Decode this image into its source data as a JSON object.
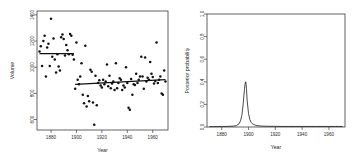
{
  "figure": {
    "title": "",
    "background": "#ffffff",
    "point_color": "#111111",
    "line_color": "#101010",
    "axis_color": "#3d3d3d"
  },
  "chart_data": [
    {
      "type": "scatter",
      "panel": "left",
      "title": "",
      "xlabel": "Year",
      "ylabel": "Volume",
      "xlim": [
        1869,
        1972
      ],
      "ylim": [
        520,
        1430
      ],
      "grid": false,
      "legend": null,
      "xticks": [
        1880,
        1900,
        1920,
        1940,
        1960
      ],
      "xticklabels": [
        "1880",
        "1900",
        "1920",
        "1940",
        "1960"
      ],
      "yticks": [
        600,
        800,
        1000,
        1200,
        1400
      ],
      "yticklabels": [
        "600",
        "800",
        "1000",
        "1200",
        "1400"
      ],
      "x": [
        1871,
        1872,
        1873,
        1874,
        1875,
        1876,
        1877,
        1878,
        1879,
        1880,
        1881,
        1882,
        1883,
        1884,
        1885,
        1886,
        1887,
        1888,
        1889,
        1890,
        1891,
        1892,
        1893,
        1894,
        1895,
        1896,
        1897,
        1898,
        1899,
        1900,
        1901,
        1902,
        1903,
        1904,
        1905,
        1906,
        1907,
        1908,
        1909,
        1910,
        1911,
        1912,
        1913,
        1914,
        1915,
        1916,
        1917,
        1918,
        1919,
        1920,
        1921,
        1922,
        1923,
        1924,
        1925,
        1926,
        1927,
        1928,
        1929,
        1930,
        1931,
        1932,
        1933,
        1934,
        1935,
        1936,
        1937,
        1938,
        1939,
        1940,
        1941,
        1942,
        1943,
        1944,
        1945,
        1946,
        1947,
        1948,
        1949,
        1950,
        1951,
        1952,
        1953,
        1954,
        1955,
        1956,
        1957,
        1958,
        1959,
        1960,
        1961,
        1962,
        1963,
        1964,
        1965,
        1966,
        1967,
        1968,
        1969,
        1970
      ],
      "y": [
        1120,
        1160,
        1010,
        1200,
        1240,
        930,
        1150,
        1180,
        1010,
        1370,
        1080,
        1220,
        1060,
        960,
        1100,
        1005,
        975,
        1230,
        1250,
        1215,
        1090,
        1170,
        1130,
        1100,
        1255,
        1240,
        1095,
        1060,
        835,
        1190,
        905,
        870,
        930,
        1030,
        790,
        725,
        1165,
        700,
        780,
        740,
        980,
        965,
        730,
        560,
        935,
        710,
        880,
        900,
        860,
        845,
        905,
        870,
        890,
        1020,
        855,
        935,
        840,
        875,
        890,
        825,
        1030,
        840,
        880,
        915,
        905,
        825,
        860,
        845,
        1000,
        880,
        690,
        675,
        910,
        790,
        870,
        865,
        950,
        880,
        905,
        930,
        1080,
        930,
        835,
        1075,
        890,
        920,
        905,
        1040,
        950,
        925,
        875,
        895,
        1190,
        880,
        905,
        930,
        800,
        790,
        975,
        890
      ],
      "fit_lines": [
        {
          "name": "segment-1",
          "x_start": 1871,
          "x_end": 1898,
          "y_start": 1105,
          "y_end": 1105
        },
        {
          "name": "segment-2",
          "x_start": 1899,
          "x_end": 1970,
          "y_start": 868,
          "y_end": 905
        }
      ]
    },
    {
      "type": "line",
      "panel": "right",
      "title": "",
      "xlabel": "Year",
      "ylabel": "Posterior probability",
      "xlim": [
        1869,
        1972
      ],
      "ylim": [
        0.0,
        1.0
      ],
      "grid": false,
      "legend": null,
      "xticks": [
        1880,
        1900,
        1920,
        1940,
        1960
      ],
      "xticklabels": [
        "1880",
        "1900",
        "1920",
        "1940",
        "1960"
      ],
      "yticks": [
        0.0,
        0.2,
        0.4,
        0.6,
        0.8,
        1.0
      ],
      "yticklabels": [
        "0.0",
        "0.2",
        "0.4",
        "0.6",
        "0.8",
        "1.0"
      ],
      "peak_x": 1898,
      "peak_y": 0.4,
      "x": [
        1871,
        1874,
        1877,
        1880,
        1883,
        1886,
        1889,
        1891,
        1893,
        1894,
        1895,
        1896,
        1897,
        1897.5,
        1898,
        1898.5,
        1899,
        1900,
        1901,
        1902,
        1903,
        1905,
        1907,
        1910,
        1913,
        1916,
        1920,
        1925,
        1930,
        1935,
        1940,
        1945,
        1950,
        1955,
        1960,
        1965,
        1970
      ],
      "y": [
        0.003,
        0.004,
        0.004,
        0.005,
        0.005,
        0.006,
        0.008,
        0.012,
        0.03,
        0.055,
        0.1,
        0.2,
        0.34,
        0.39,
        0.4,
        0.33,
        0.23,
        0.12,
        0.065,
        0.04,
        0.028,
        0.016,
        0.011,
        0.008,
        0.007,
        0.006,
        0.006,
        0.005,
        0.005,
        0.005,
        0.005,
        0.005,
        0.005,
        0.005,
        0.005,
        0.005,
        0.005
      ]
    }
  ]
}
